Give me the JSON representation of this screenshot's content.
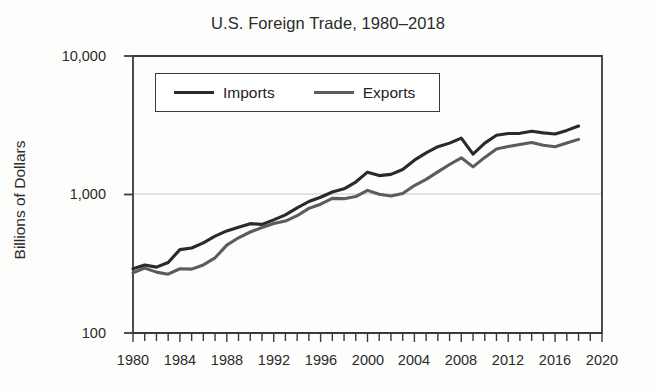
{
  "figure": {
    "title": "U.S. Foreign Trade, 1980–2018",
    "background_color": "#fdfdfc",
    "text_color": "#2b2b2b"
  },
  "axes": {
    "y_label": "Billions of Dollars",
    "y_scale": "log",
    "y_ticks": [
      "100",
      "1,000",
      "10,000"
    ],
    "x_ticks": [
      "1980",
      "1984",
      "1988",
      "1992",
      "1996",
      "2000",
      "2004",
      "2008",
      "2012",
      "2016",
      "2020"
    ],
    "x_minor_tick_interval_years": 1,
    "gridline_values": [
      "1,000"
    ]
  },
  "legend": {
    "position": "top-left-inside",
    "entries": [
      {
        "label": "Imports",
        "color": "#2a2a2a"
      },
      {
        "label": "Exports",
        "color": "#5c5c5c"
      }
    ]
  },
  "chart_data": {
    "type": "line",
    "title": "U.S. Foreign Trade, 1980–2018",
    "xlabel": "",
    "ylabel": "Billions of Dollars",
    "yscale": "log",
    "ylim": [
      100,
      10000
    ],
    "xlim": [
      1980,
      2020
    ],
    "grid": true,
    "legend_position": "upper left",
    "x": [
      1980,
      1981,
      1982,
      1983,
      1984,
      1985,
      1986,
      1987,
      1988,
      1989,
      1990,
      1991,
      1992,
      1993,
      1994,
      1995,
      1996,
      1997,
      1998,
      1999,
      2000,
      2001,
      2002,
      2003,
      2004,
      2005,
      2006,
      2007,
      2008,
      2009,
      2010,
      2011,
      2012,
      2013,
      2014,
      2015,
      2016,
      2017,
      2018
    ],
    "series": [
      {
        "name": "Imports",
        "color": "#2a2a2a",
        "values": [
          291,
          310,
          299,
          323,
          400,
          411,
          448,
          500,
          546,
          581,
          616,
          609,
          656,
          713,
          801,
          890,
          955,
          1043,
          1099,
          1230,
          1450,
          1369,
          1397,
          1514,
          1769,
          1997,
          2212,
          2350,
          2556,
          1956,
          2348,
          2675,
          2760,
          2764,
          2866,
          2786,
          2737,
          2903,
          3122
        ]
      },
      {
        "name": "Exports",
        "color": "#5c5c5c",
        "values": [
          272,
          294,
          275,
          266,
          291,
          289,
          310,
          349,
          431,
          487,
          536,
          578,
          617,
          643,
          703,
          794,
          851,
          938,
          933,
          966,
          1071,
          1005,
          975,
          1018,
          1161,
          1286,
          1457,
          1646,
          1841,
          1583,
          1853,
          2127,
          2219,
          2294,
          2376,
          2265,
          2215,
          2351,
          2501
        ]
      }
    ]
  }
}
